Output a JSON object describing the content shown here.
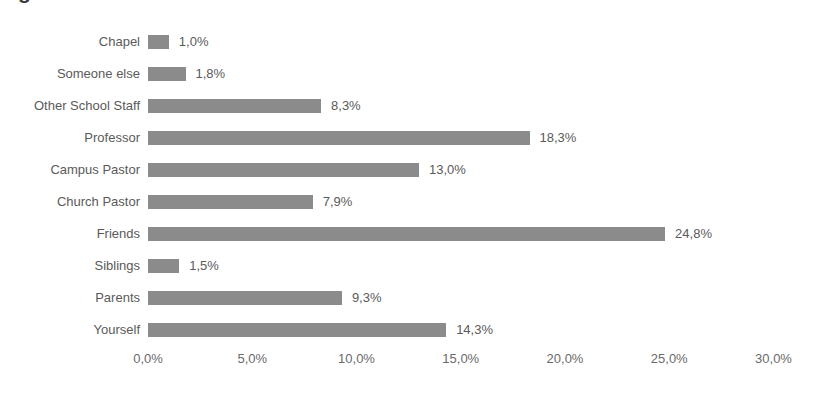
{
  "title_fragment": "g",
  "colors": {
    "bar": "#8b8b8b",
    "label_text": "#5a5a5a",
    "tick_text": "#6a6a6a",
    "background": "#ffffff"
  },
  "chart_data": {
    "type": "bar",
    "orientation": "horizontal",
    "title": "",
    "xlabel": "",
    "ylabel": "",
    "xlim": [
      0,
      30
    ],
    "grid": false,
    "legend": false,
    "decimal_separator": ",",
    "value_suffix": "%",
    "categories": [
      "Chapel",
      "Someone else",
      "Other School Staff",
      "Professor",
      "Campus Pastor",
      "Church Pastor",
      "Friends",
      "Siblings",
      "Parents",
      "Yourself"
    ],
    "values": [
      1.0,
      1.8,
      8.3,
      18.3,
      13.0,
      7.9,
      24.8,
      1.5,
      9.3,
      14.3
    ],
    "value_labels": [
      "1,0%",
      "1,8%",
      "8,3%",
      "18,3%",
      "13,0%",
      "7,9%",
      "24,8%",
      "1,5%",
      "9,3%",
      "14,3%"
    ],
    "xticks": [
      0,
      5,
      10,
      15,
      20,
      25,
      30
    ],
    "xtick_labels": [
      "0,0%",
      "5,0%",
      "10,0%",
      "15,0%",
      "20,0%",
      "25,0%",
      "30,0%"
    ]
  }
}
